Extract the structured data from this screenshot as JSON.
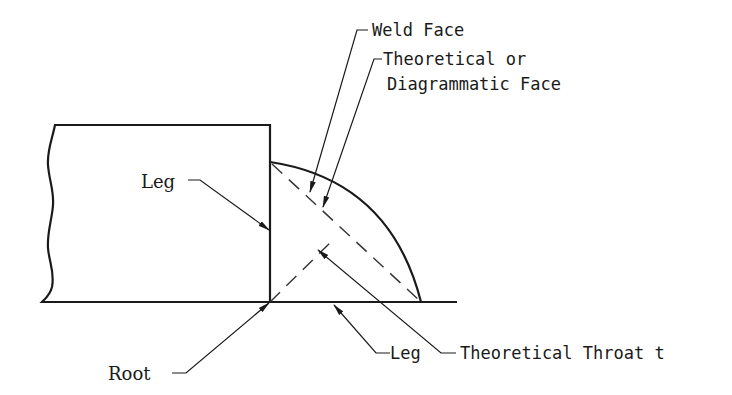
{
  "diagram": {
    "colors": {
      "line": "#1a1a1a",
      "background": "#ffffff",
      "dashed": "#333333"
    },
    "labels": {
      "weld_face": "Weld Face",
      "theoretical_face_line1": "Theoretical or",
      "theoretical_face_line2": "Diagrammatic Face",
      "leg_vertical": "Leg",
      "root": "Root",
      "leg_horizontal": "Leg",
      "theoretical_throat": "Theoretical Throat t"
    },
    "elements": [
      {
        "id": "base-plate",
        "type": "rectangle-with-break-edge"
      },
      {
        "id": "bottom-plate",
        "type": "line"
      },
      {
        "id": "weld-face-arc",
        "type": "convex-arc"
      },
      {
        "id": "theoretical-face-line",
        "type": "dashed-line"
      },
      {
        "id": "throat-line",
        "type": "dashed-line"
      }
    ]
  }
}
